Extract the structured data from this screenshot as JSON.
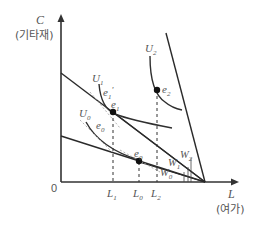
{
  "diagram": {
    "title": "",
    "y_axis": {
      "symbol": "C",
      "label": "(기타재)"
    },
    "x_axis": {
      "symbol": "L",
      "label": "(여가)"
    },
    "origin": "0",
    "x_ticks": [
      {
        "sym": "L",
        "sub": "1"
      },
      {
        "sym": "L",
        "sub": "0"
      },
      {
        "sym": "L",
        "sub": "2"
      }
    ],
    "indifference_curves": [
      {
        "sym": "U",
        "sub": "0"
      },
      {
        "sym": "U",
        "sub": "1"
      },
      {
        "sym": "U",
        "sub": "2"
      }
    ],
    "equilibria": [
      {
        "sym": "e",
        "sub": "0"
      },
      {
        "sym": "e",
        "sub": "1"
      },
      {
        "sym": "e",
        "sub": "2"
      }
    ],
    "intermediate_points": [
      {
        "sym": "e",
        "sub": "0",
        "prime": "'"
      },
      {
        "sym": "e",
        "sub": "1",
        "prime": "'"
      }
    ],
    "wage_labels": [
      {
        "sym": "W",
        "sub": "0"
      },
      {
        "sym": "W",
        "sub": "1"
      },
      {
        "sym": "W",
        "sub": "2"
      }
    ],
    "colors": {
      "line": "#2a2a2a",
      "text": "#555555",
      "background": "#ffffff"
    }
  }
}
